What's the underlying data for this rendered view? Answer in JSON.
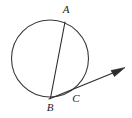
{
  "figure": {
    "canvas": {
      "width": 132,
      "height": 118
    },
    "background_color": "#ffffff",
    "stroke_color": "#2b2b2b",
    "circle_stroke_color": "#3a3a3a",
    "label_color": "#1a1a1a"
  },
  "chart_data": {
    "type": "diagram",
    "shapes": [
      {
        "kind": "circle",
        "name": "main-circle",
        "cx": 50,
        "cy": 58.5,
        "r": 38.5,
        "stroke": "#3a3a3a",
        "fill": "none"
      },
      {
        "kind": "segment",
        "name": "chord-ab",
        "from": "A",
        "to": "B",
        "x1": 65,
        "y1": 22,
        "x2": 50.5,
        "y2": 98,
        "stroke": "#2b2b2b"
      },
      {
        "kind": "ray",
        "name": "secant-ray-bc",
        "from": "B",
        "through": "C",
        "x1": 49,
        "y1": 99,
        "x2": 124,
        "y2": 68.5,
        "arrow_at": "end",
        "stroke": "#2b2b2b"
      }
    ],
    "points": [
      {
        "name": "A",
        "label": "A",
        "x": 65,
        "y": 22,
        "label_x": 66,
        "label_y": 13,
        "on_circle": true
      },
      {
        "name": "B",
        "label": "B",
        "x": 50,
        "y": 97.5,
        "label_x": 50,
        "label_y": 111,
        "on_circle": true
      },
      {
        "name": "C",
        "label": "C",
        "x": 75.5,
        "y": 90,
        "label_x": 76,
        "label_y": 102,
        "on_circle": true
      }
    ],
    "arrowhead": {
      "tip_x": 125,
      "tip_y": 67.5,
      "polygon": "125,67.5 111,70.5 114.5,76.5",
      "fill": "#2b2b2b"
    },
    "labels": [
      "A",
      "B",
      "C"
    ],
    "xlabel": "",
    "ylabel": "",
    "grid": false,
    "legend": null
  }
}
